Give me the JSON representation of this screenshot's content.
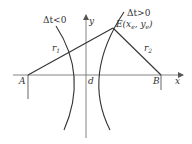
{
  "diagram": {
    "labels": {
      "delta_neg": "Δt<0",
      "delta_pos": "Δt>0",
      "y_axis": "y",
      "x_axis": "x",
      "point_a": "A",
      "point_b": "B",
      "point_d": "d",
      "r1": "r",
      "r1_sub": "1",
      "r2": "r",
      "r2_sub": "2",
      "point_e": "E(x",
      "point_e_sub1": "e",
      "point_e_mid": ", y",
      "point_e_sub2": "e",
      "point_e_end": ")"
    },
    "colors": {
      "stroke": "#333333",
      "axis": "#666666",
      "background": "#ffffff"
    }
  }
}
